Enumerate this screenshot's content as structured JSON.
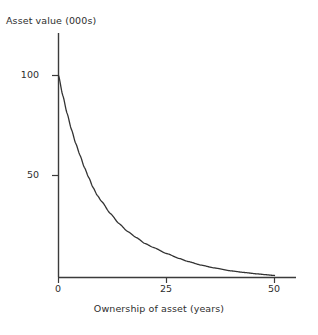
{
  "chart_data": {
    "type": "line",
    "title": "",
    "xlabel": "Ownership of asset (years)",
    "ylabel": "Asset value (000s)",
    "xlim": [
      0,
      55
    ],
    "ylim": [
      0,
      115
    ],
    "grid": false,
    "legend": null,
    "xticks": [
      "0",
      "25",
      "50"
    ],
    "xtick_values": [
      0,
      25,
      50
    ],
    "yticks": [
      "100",
      "50"
    ],
    "ytick_values": [
      100,
      50
    ],
    "series": [
      {
        "name": "Asset value",
        "color": "#333333",
        "x": [
          0,
          1,
          2,
          3,
          4,
          5,
          6,
          7,
          8,
          9,
          10,
          12,
          14,
          16,
          18,
          20,
          22,
          25,
          28,
          30,
          33,
          36,
          40,
          43,
          46,
          48,
          50
        ],
        "values": [
          100,
          90,
          81,
          73,
          66,
          60,
          54,
          49,
          44,
          40,
          37,
          31,
          26,
          22,
          19,
          16,
          14,
          11,
          8.5,
          7,
          5.2,
          3.8,
          2.3,
          1.5,
          0.8,
          0.4,
          0
        ]
      }
    ],
    "annotations": []
  },
  "axes": {
    "y_axis_name": "y-axis-line",
    "x_axis_name": "x-axis-line"
  }
}
